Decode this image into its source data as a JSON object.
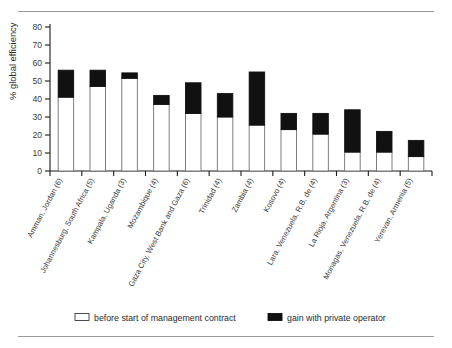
{
  "chart_data": {
    "type": "bar",
    "subtype": "stacked-bar",
    "title": "",
    "xlabel": "",
    "ylabel": "% global efficiency",
    "ylim": [
      0,
      80
    ],
    "yticks": [
      0,
      10,
      20,
      30,
      40,
      50,
      60,
      70,
      80
    ],
    "ytick_labels": [
      "0",
      "10",
      "20",
      "30",
      "40",
      "50",
      "60",
      "70",
      "80"
    ],
    "grid": false,
    "legend_position": "bottom",
    "categories": [
      "Amman, Jordan (6)",
      "Johannesburg, South Africa (5)",
      "Kampala, Uganda (3)",
      "Mozambique (4)",
      "Gaza City, West Bank and Gaza (6)",
      "Trinidad (4)",
      "Zambia (4)",
      "Kosovo (4)",
      "Lara, Venezuela, R.B. de (4)",
      "La Rioja, Argentina (3)",
      "Monagas, Venezuela, R.B. de (4)",
      "Yerevan, Armenia (5)"
    ],
    "series": [
      {
        "name": "before start of management contract",
        "color": "#ffffff",
        "values": [
          41,
          47,
          51.5,
          37,
          32,
          30,
          25.5,
          23,
          20.5,
          10.5,
          10.5,
          8
        ]
      },
      {
        "name": "gain with private operator",
        "color": "#111111",
        "values": [
          15,
          9,
          3,
          5,
          17,
          13,
          29.5,
          9,
          11.5,
          23.5,
          11.5,
          9
        ]
      }
    ],
    "totals": [
      56,
      56,
      54.5,
      42,
      49,
      43,
      55,
      32,
      32,
      34,
      22,
      17
    ]
  },
  "legend": {
    "items": [
      {
        "label": "before start of management contract",
        "swatch": "white-square"
      },
      {
        "label": "gain with private operator",
        "swatch": "black-square"
      }
    ]
  },
  "colors": {
    "bar_base": "#ffffff",
    "bar_gain": "#111111",
    "axis": "#1a1a1a",
    "rule": "#9a9a9a",
    "text": "#2b2b2b"
  }
}
